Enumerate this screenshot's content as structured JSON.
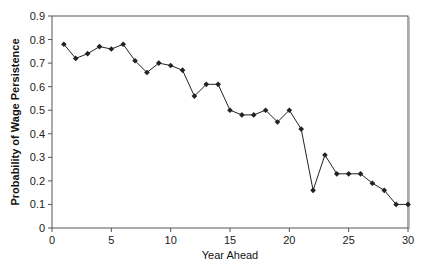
{
  "chart_data": {
    "type": "line",
    "title": "",
    "xlabel": "Year Ahead",
    "ylabel": "Probability of Wage Persistence",
    "xlim": [
      0,
      30
    ],
    "ylim": [
      0,
      0.9
    ],
    "x_ticks": [
      "0",
      "5",
      "10",
      "15",
      "20",
      "25",
      "30"
    ],
    "y_ticks": [
      "0",
      "0.1",
      "0.2",
      "0.3",
      "0.4",
      "0.5",
      "0.6",
      "0.7",
      "0.8",
      "0.9"
    ],
    "grid": false,
    "legend": null,
    "series": [
      {
        "name": "Probability of Wage Persistence",
        "color": "#222222",
        "marker": "diamond",
        "x": [
          1,
          2,
          3,
          4,
          5,
          6,
          7,
          8,
          9,
          10,
          11,
          12,
          13,
          14,
          15,
          16,
          17,
          18,
          19,
          20,
          21,
          22,
          23,
          24,
          25,
          26,
          27,
          28,
          29,
          30
        ],
        "values": [
          0.78,
          0.72,
          0.74,
          0.77,
          0.76,
          0.78,
          0.71,
          0.66,
          0.7,
          0.69,
          0.67,
          0.56,
          0.61,
          0.61,
          0.5,
          0.48,
          0.48,
          0.5,
          0.45,
          0.5,
          0.42,
          0.16,
          0.31,
          0.23,
          0.23,
          0.23,
          0.19,
          0.16,
          0.1,
          0.1
        ]
      }
    ]
  }
}
